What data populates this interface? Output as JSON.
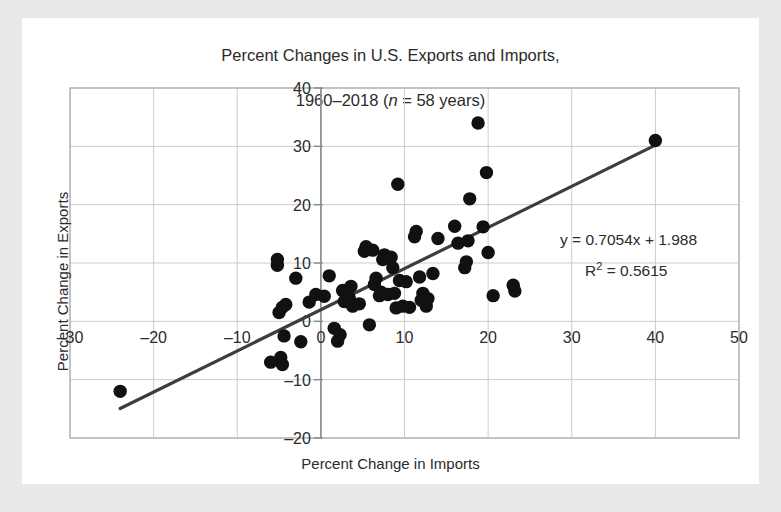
{
  "figure": {
    "title_line1": "Percent Changes in U.S. Exports and Imports,",
    "title_line2_pre": "1960–2018 (",
    "title_line2_ital": "n",
    "title_line2_post": " = 58 years)",
    "background_color": "#e9e9e9",
    "card_color": "#ffffff"
  },
  "chart_data": {
    "type": "scatter",
    "title": "Percent Changes in U.S. Exports and Imports, 1960–2018 (n = 58 years)",
    "xlabel": "Percent Change in Imports",
    "ylabel": "Percent Change in Exports",
    "xlim": [
      -30,
      50
    ],
    "ylim": [
      -20,
      40
    ],
    "xticks": [
      -30,
      -20,
      -10,
      0,
      10,
      20,
      30,
      40,
      50
    ],
    "yticks": [
      -20,
      -10,
      0,
      10,
      20,
      30,
      40
    ],
    "xtick_labels": [
      "–30",
      "–20",
      "–10",
      "0",
      "10",
      "20",
      "30",
      "40",
      "50"
    ],
    "ytick_labels": [
      "–20",
      "–10",
      "0",
      "10",
      "20",
      "30",
      "40"
    ],
    "grid": true,
    "legend": "none",
    "n": 58,
    "marker_color": "#111111",
    "marker_size": 9,
    "trendline": {
      "type": "linear",
      "slope": 0.7054,
      "intercept": 1.988,
      "r_squared": 0.5615,
      "color": "#3d3d3d",
      "x_start": -24.0,
      "x_end": 40.0,
      "equation_label": "y = 0.7054x + 1.988",
      "r2_label_prefix": "R",
      "r2_label_sup": "2",
      "r2_label_rest": " = 0.5615"
    },
    "points": [
      [
        -24.0,
        -12.0
      ],
      [
        -6.0,
        -7.0
      ],
      [
        -4.8,
        -6.2
      ],
      [
        -4.6,
        -7.4
      ],
      [
        -4.4,
        -2.5
      ],
      [
        -5.2,
        9.6
      ],
      [
        -5.2,
        10.6
      ],
      [
        -5.0,
        1.5
      ],
      [
        -4.6,
        2.4
      ],
      [
        -4.2,
        2.9
      ],
      [
        -3.0,
        7.4
      ],
      [
        -2.4,
        -3.5
      ],
      [
        -1.4,
        3.3
      ],
      [
        -0.6,
        4.6
      ],
      [
        0.4,
        4.3
      ],
      [
        1.0,
        7.8
      ],
      [
        1.6,
        -1.2
      ],
      [
        2.0,
        -3.4
      ],
      [
        2.3,
        -2.3
      ],
      [
        2.6,
        5.3
      ],
      [
        2.8,
        3.4
      ],
      [
        3.4,
        4.0
      ],
      [
        3.6,
        6.0
      ],
      [
        3.8,
        2.6
      ],
      [
        4.6,
        3.0
      ],
      [
        5.2,
        12.0
      ],
      [
        5.4,
        12.8
      ],
      [
        5.8,
        -0.6
      ],
      [
        6.2,
        12.2
      ],
      [
        6.4,
        6.3
      ],
      [
        6.6,
        7.4
      ],
      [
        7.0,
        4.4
      ],
      [
        7.2,
        5.0
      ],
      [
        7.4,
        10.6
      ],
      [
        7.6,
        11.4
      ],
      [
        8.0,
        4.6
      ],
      [
        8.4,
        11.0
      ],
      [
        8.6,
        9.2
      ],
      [
        8.8,
        4.8
      ],
      [
        9.0,
        2.3
      ],
      [
        9.2,
        23.5
      ],
      [
        9.4,
        7.0
      ],
      [
        9.8,
        2.6
      ],
      [
        10.2,
        6.8
      ],
      [
        10.6,
        2.4
      ],
      [
        11.2,
        14.5
      ],
      [
        11.4,
        15.4
      ],
      [
        11.8,
        7.6
      ],
      [
        12.0,
        3.6
      ],
      [
        12.2,
        4.8
      ],
      [
        12.6,
        2.6
      ],
      [
        12.8,
        3.9
      ],
      [
        13.4,
        8.2
      ],
      [
        14.0,
        14.2
      ],
      [
        16.0,
        16.3
      ],
      [
        16.4,
        13.4
      ],
      [
        17.2,
        9.2
      ],
      [
        17.4,
        10.2
      ],
      [
        17.6,
        13.8
      ],
      [
        17.8,
        21.0
      ],
      [
        18.8,
        34.0
      ],
      [
        19.4,
        16.2
      ],
      [
        19.8,
        25.5
      ],
      [
        20.0,
        11.8
      ],
      [
        20.6,
        4.4
      ],
      [
        23.0,
        6.2
      ],
      [
        23.2,
        5.2
      ],
      [
        40.0,
        31.0
      ]
    ]
  }
}
